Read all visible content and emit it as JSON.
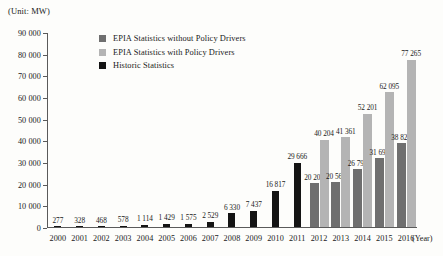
{
  "unit_label": "(Unit: MW)",
  "axis_x_title": "(Year)",
  "legend": {
    "items": [
      {
        "label": "EPIA Statistics without Policy Drivers",
        "swatch": "without",
        "color": "#6f6f6f"
      },
      {
        "label": "EPIA Statistics with Policy Drivers",
        "swatch": "with",
        "color": "#b4b4b4"
      },
      {
        "label": "Historic Statistics",
        "swatch": "historic",
        "color": "#141414"
      }
    ]
  },
  "chart_data": {
    "type": "bar",
    "title": "",
    "xlabel": "(Year)",
    "ylabel": "(Unit: MW)",
    "ylim": [
      0,
      90000
    ],
    "ytick_labels": [
      "90 000",
      "80 000",
      "70 000",
      "60 000",
      "50 000",
      "40 000",
      "30 000",
      "20 000",
      "10 000",
      "0"
    ],
    "ytick_values": [
      90000,
      80000,
      70000,
      60000,
      50000,
      40000,
      30000,
      20000,
      10000,
      0
    ],
    "grid": false,
    "legend_position": "top-center",
    "categories": [
      "2000",
      "2001",
      "2002",
      "2003",
      "2004",
      "2005",
      "2006",
      "2007",
      "2008",
      "2009",
      "2010",
      "2011",
      "2012",
      "2013",
      "2014",
      "2015",
      "2016"
    ],
    "series": [
      {
        "name": "Historic Statistics",
        "color": "#141414",
        "values": [
          277,
          328,
          468,
          578,
          1114,
          1429,
          1575,
          2529,
          6330,
          7437,
          16817,
          29666,
          null,
          null,
          null,
          null,
          null
        ],
        "labels": [
          "277",
          "328",
          "468",
          "578",
          "1 114",
          "1 429",
          "1 575",
          "2 529",
          "6 330",
          "7 437",
          "16 817",
          "29 666",
          "",
          "",
          "",
          "",
          ""
        ]
      },
      {
        "name": "EPIA Statistics without Policy Drivers",
        "color": "#6f6f6f",
        "values": [
          null,
          null,
          null,
          null,
          null,
          null,
          null,
          null,
          null,
          null,
          null,
          null,
          20206,
          20565,
          26790,
          31690,
          38822
        ],
        "labels": [
          "",
          "",
          "",
          "",
          "",
          "",
          "",
          "",
          "",
          "",
          "",
          "",
          "20 206",
          "20 565",
          "26 790",
          "31 690",
          "38 822"
        ]
      },
      {
        "name": "EPIA Statistics with Policy Drivers",
        "color": "#b4b4b4",
        "values": [
          null,
          null,
          null,
          null,
          null,
          null,
          null,
          null,
          null,
          null,
          null,
          null,
          40204,
          41361,
          52201,
          62095,
          77265
        ],
        "labels": [
          "",
          "",
          "",
          "",
          "",
          "",
          "",
          "",
          "",
          "",
          "",
          "",
          "40 204",
          "41 361",
          "52 201",
          "62 095",
          "77 265"
        ]
      }
    ]
  }
}
